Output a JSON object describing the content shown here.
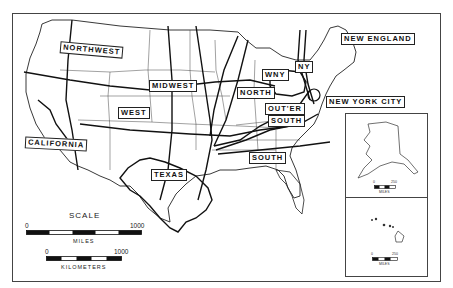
{
  "map": {
    "type": "regional map of the United States",
    "region_labels": {
      "northwest": "NORTHWEST",
      "midwest": "MIDWEST",
      "west": "WEST",
      "california": "CALIFORNIA",
      "texas": "TEXAS",
      "north": "NORTH",
      "wny": "WNY",
      "ny": "NY",
      "new_england": "NEW ENGLAND",
      "new_york_city": "NEW YORK CITY",
      "outer_south": "OUTER SOUTH",
      "outer_south_line1": "OUT'ER",
      "outer_south_line2": "SOUTH",
      "south": "SOUTH"
    },
    "scale": {
      "title": "SCALE",
      "miles": {
        "start": "0",
        "end": "1000",
        "unit": "MILES"
      },
      "kilometers": {
        "start": "0",
        "end": "1000",
        "unit": "KILOMETERS"
      }
    },
    "insets": {
      "alaska": {
        "name": "Alaska",
        "scale_start": "0",
        "scale_end": "250",
        "unit": "MILES"
      },
      "hawaii": {
        "name": "Hawaii",
        "scale_start": "0",
        "scale_end": "250",
        "unit": "MILES"
      }
    }
  }
}
